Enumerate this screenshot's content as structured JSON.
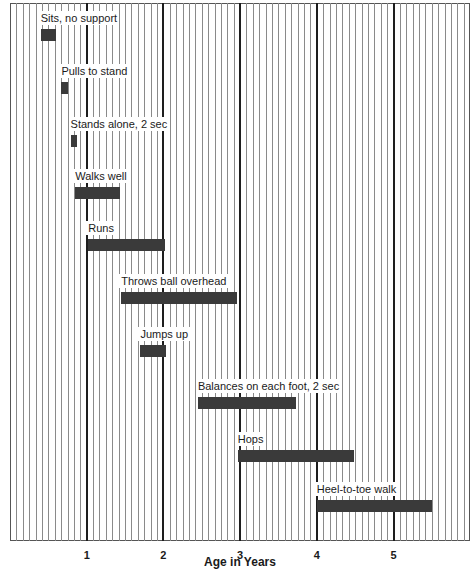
{
  "chart_data": {
    "type": "bar",
    "subtype": "horizontal-range (gantt)",
    "title": "",
    "xlabel": "Age in Years",
    "ylabel": "",
    "xlim": [
      0,
      6
    ],
    "x_ticks": [
      1,
      2,
      3,
      4,
      5
    ],
    "x_tick_labels": [
      "1",
      "2",
      "3",
      "4",
      "5"
    ],
    "grid": {
      "minor_interval_years": 0.0833,
      "minor_interval_label": "1 month",
      "major_interval_years": 1
    },
    "legend": null,
    "bar_color": "#3a3a3a",
    "series": [
      {
        "name": "Sits, no support",
        "start": 0.4,
        "end": 0.6
      },
      {
        "name": "Pulls to stand",
        "start": 0.67,
        "end": 0.75
      },
      {
        "name": "Stands alone, 2 sec",
        "start": 0.79,
        "end": 0.87
      },
      {
        "name": "Walks well",
        "start": 0.85,
        "end": 1.43
      },
      {
        "name": "Runs",
        "start": 1.02,
        "end": 2.02
      },
      {
        "name": "Throws ball overhead",
        "start": 1.45,
        "end": 2.96
      },
      {
        "name": "Jumps up",
        "start": 1.7,
        "end": 2.03
      },
      {
        "name": "Balances on each foot, 2 sec",
        "start": 2.45,
        "end": 3.73
      },
      {
        "name": "Hops",
        "start": 2.97,
        "end": 4.49
      },
      {
        "name": "Heel-to-toe walk",
        "start": 4.0,
        "end": 5.5
      }
    ]
  },
  "layout": {
    "x0_px": 10,
    "px_per_year": 76.7,
    "rows_y_px": [
      29,
      82,
      135,
      187,
      239,
      292,
      345,
      397,
      450,
      500
    ]
  }
}
